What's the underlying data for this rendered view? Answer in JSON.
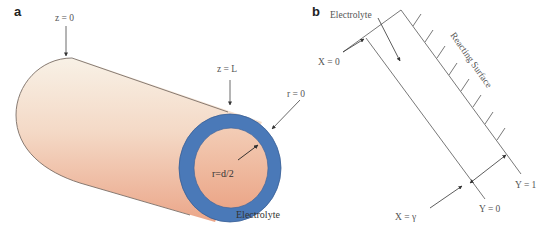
{
  "panel_a": {
    "label": "a",
    "z0_label": "z = 0",
    "zL_label": "z = L",
    "r0_label": "r = 0",
    "radius_label": "r=d/2",
    "electrolyte_label": "Electrolyte",
    "colors": {
      "cylinder_top": "#f7eee1",
      "cylinder_bottom": "#eeab8e",
      "ring": "#4a79b8",
      "ring_dark": "#3a5f96",
      "outline": "#7a6e66"
    }
  },
  "panel_b": {
    "label": "b",
    "electrolyte_label": "Electrolyte",
    "x0_label": "X = 0",
    "surface_label": "Reacting Surface",
    "y1_label": "Y = 1",
    "y0_label": "Y = 0",
    "xgamma_label": "X = γ",
    "line_color": "#555555"
  }
}
